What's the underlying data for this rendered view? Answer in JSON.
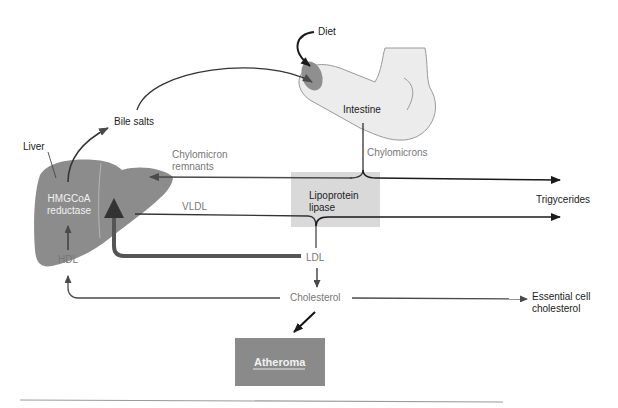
{
  "diagram": {
    "colors": {
      "liver": "#8c8c8c",
      "intestine_fill": "#ececec",
      "lipase_box": "#d9d9d9",
      "atheroma_box": "#8a8a8a",
      "arrow_dark": "#1a1a1a",
      "arrow_grey": "#4a4a4a",
      "text_grey": "#777777"
    },
    "nodes": {
      "diet": "Diet",
      "intestine": "Intestine",
      "bile_salts": "Bile salts",
      "liver": "Liver",
      "hmgcoa_line1": "HMGCoA",
      "hmgcoa_line2": "reductase",
      "chylomicron_remnants_line1": "Chylomicron",
      "chylomicron_remnants_line2": "remnants",
      "chylomicrons": "Chylomicrons",
      "lipase_line1": "Lipoprotein",
      "lipase_line2": "lipase",
      "triglycerides": "Trigycerides",
      "vldl": "VLDL",
      "hdl": "HDL",
      "ldl": "LDL",
      "cholesterol": "Cholesterol",
      "essential_line1": "Essential cell",
      "essential_line2": "cholesterol",
      "atheroma": "Atheroma"
    },
    "edges": [
      {
        "from": "Diet",
        "to": "Intestine"
      },
      {
        "from": "Bile salts",
        "to": "Intestine"
      },
      {
        "from": "Liver",
        "to": "Bile salts"
      },
      {
        "from": "Intestine",
        "to": "Chylomicrons"
      },
      {
        "from": "Chylomicrons",
        "to": "Trigycerides"
      },
      {
        "from": "Chylomicrons",
        "to": "Chylomicron remnants (Liver)"
      },
      {
        "from": "Liver",
        "to": "VLDL"
      },
      {
        "from": "VLDL",
        "to": "Trigycerides"
      },
      {
        "from": "VLDL",
        "to": "LDL"
      },
      {
        "from": "LDL",
        "to": "Liver"
      },
      {
        "from": "LDL",
        "to": "Cholesterol"
      },
      {
        "from": "Cholesterol",
        "to": "HDL"
      },
      {
        "from": "HDL",
        "to": "HMGCoA reductase"
      },
      {
        "from": "Cholesterol",
        "to": "Essential cell cholesterol"
      },
      {
        "from": "Cholesterol",
        "to": "Atheroma"
      }
    ]
  }
}
